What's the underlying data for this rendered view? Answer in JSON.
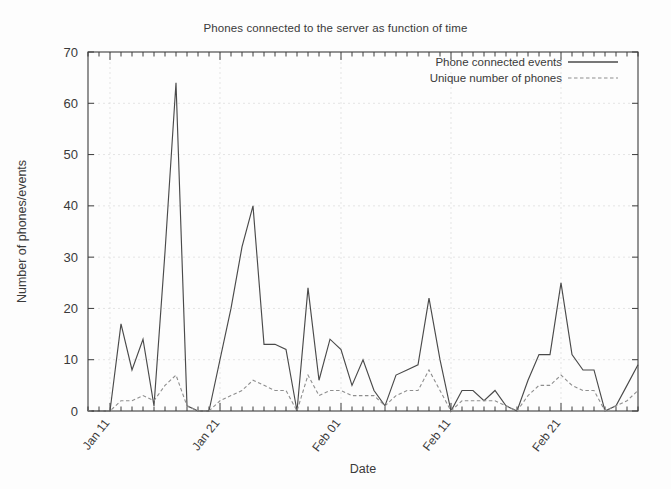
{
  "chart_data": {
    "type": "line",
    "title": "Phones connected to the server as function of time",
    "xlabel": "Date",
    "ylabel": "Number of phones/events",
    "ylim": [
      0,
      70
    ],
    "yticks": [
      0,
      10,
      20,
      30,
      40,
      50,
      60,
      70
    ],
    "xticks": [
      "Jan 11",
      "Jan 21",
      "Feb 01",
      "Feb 11",
      "Feb 21"
    ],
    "xtick_indices": [
      2,
      12,
      23,
      33,
      43
    ],
    "grid": true,
    "legend_position": "top-right",
    "x": [
      "Jan 09",
      "Jan 10",
      "Jan 11",
      "Jan 12",
      "Jan 13",
      "Jan 14",
      "Jan 15",
      "Jan 16",
      "Jan 17",
      "Jan 18",
      "Jan 19",
      "Jan 20",
      "Jan 21",
      "Jan 22",
      "Jan 23",
      "Jan 24",
      "Jan 25",
      "Jan 26",
      "Jan 27",
      "Jan 28",
      "Jan 29",
      "Jan 30",
      "Jan 31",
      "Feb 01",
      "Feb 02",
      "Feb 03",
      "Feb 04",
      "Feb 05",
      "Feb 06",
      "Feb 07",
      "Feb 08",
      "Feb 09",
      "Feb 10",
      "Feb 11",
      "Feb 12",
      "Feb 13",
      "Feb 14",
      "Feb 15",
      "Feb 16",
      "Feb 17",
      "Feb 18",
      "Feb 19",
      "Feb 20",
      "Feb 21",
      "Feb 22",
      "Feb 23",
      "Feb 24",
      "Feb 25",
      "Feb 26",
      "Feb 27",
      "Feb 28"
    ],
    "series": [
      {
        "name": "Phone connected events",
        "style": "solid",
        "color": "#4a4a4a",
        "values": [
          0,
          0,
          0,
          17,
          8,
          14,
          1,
          31,
          64,
          1,
          0,
          0,
          10,
          20,
          32,
          40,
          13,
          13,
          12,
          0,
          24,
          6,
          14,
          12,
          5,
          10,
          4,
          1,
          7,
          8,
          9,
          22,
          10,
          0,
          4,
          4,
          2,
          4,
          1,
          0,
          6,
          11,
          11,
          25,
          11,
          8,
          8,
          0,
          1,
          5,
          9
        ]
      },
      {
        "name": "Unique number of phones",
        "style": "dashed",
        "color": "#8e8e8e",
        "values": [
          0,
          0,
          0,
          2,
          2,
          3,
          2,
          5,
          7,
          1,
          0,
          0,
          2,
          3,
          4,
          6,
          5,
          4,
          4,
          0,
          7,
          3,
          4,
          4,
          3,
          3,
          3,
          1,
          3,
          4,
          4,
          8,
          4,
          0,
          2,
          2,
          2,
          2,
          1,
          0,
          3,
          5,
          5,
          7,
          5,
          4,
          4,
          0,
          1,
          2,
          4
        ]
      }
    ]
  },
  "legend": {
    "entries": [
      {
        "label": "Phone connected events",
        "style": "solid"
      },
      {
        "label": "Unique number of phones",
        "style": "dashed"
      }
    ]
  }
}
